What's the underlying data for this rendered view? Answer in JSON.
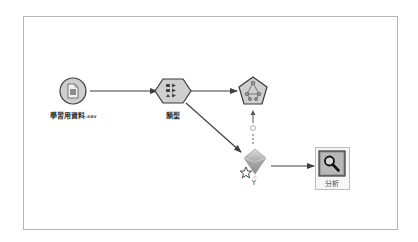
{
  "stream": {
    "nodes": [
      {
        "id": "source",
        "type": "statistics-file-source",
        "label": "學習用資料",
        "label_ext": ".sav",
        "shape": "circle",
        "icon": "document-icon"
      },
      {
        "id": "type",
        "type": "type-node",
        "label": "類型",
        "shape": "hexagon",
        "icon": "type-fields-icon"
      },
      {
        "id": "modeling",
        "type": "modeling-node",
        "label": "",
        "shape": "pentagon",
        "icon": "network-model-icon"
      },
      {
        "id": "nugget",
        "type": "model-nugget",
        "label": "Y",
        "shape": "diamond",
        "icon": "model-nugget-icon"
      },
      {
        "id": "analysis",
        "type": "analysis-node",
        "label": "分析",
        "shape": "square",
        "icon": "magnifier-icon"
      }
    ],
    "links": [
      {
        "from": "source",
        "to": "type",
        "style": "solid"
      },
      {
        "from": "type",
        "to": "modeling",
        "style": "solid"
      },
      {
        "from": "type",
        "to": "nugget",
        "style": "solid"
      },
      {
        "from": "nugget",
        "to": "modeling",
        "style": "dashed"
      },
      {
        "from": "nugget",
        "to": "analysis",
        "style": "solid"
      }
    ]
  },
  "colors": {
    "frame": "#b5b5b5",
    "node_fill": "#cfcfcf",
    "node_stroke": "#3a3a3a",
    "link": "#3f3f3f",
    "nugget_fill": "#b9b9b9",
    "analysis_fill": "#9e9e9e",
    "selection": "#bdbdbd"
  }
}
